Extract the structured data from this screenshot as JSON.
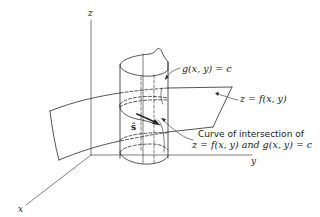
{
  "figure": {
    "axes": {
      "x_label": "x",
      "y_label": "y",
      "z_label": "z"
    },
    "labels": {
      "cylinder": "g(x, y) = c",
      "surface": "z = f(x, y)",
      "curve_line1": "Curve of intersection of",
      "curve_line2": "z = f(x, y) and g(x, y) = c",
      "unit_vector": "ŝ"
    },
    "colors": {
      "ink": "#2a2a2a",
      "background": "#ffffff"
    }
  }
}
